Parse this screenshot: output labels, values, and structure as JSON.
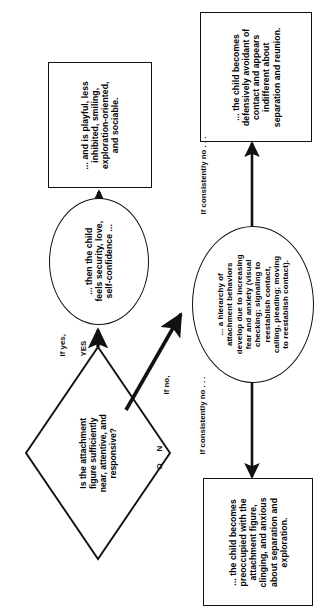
{
  "diagram": {
    "orientation_note": "rotated",
    "stroke_color": "#111111",
    "background_color": "#ffffff",
    "nodes": {
      "decision": {
        "shape": "diamond",
        "text": "Is the attachment\nfigure sufficiently\nnear, attentive, and\nresponsive?"
      },
      "secure_state": {
        "shape": "ellipse",
        "text": "... then the child\nfeels security, love,\nself-confidence ..."
      },
      "secure_outcome": {
        "shape": "rectangle",
        "text": "... and is playful, less\ninhibited, smiling,\nexploration-oriented,\nand sociable."
      },
      "anxiety_state": {
        "shape": "ellipse",
        "text": "... a hierarchy of\nattachment behaviors\ndevelop due to increasing\nfear and anxiety (visual\nchecking; signaling to\nreestablish contact,\ncalling, pleading; moving\nto reestablish contact)."
      },
      "avoidant_outcome": {
        "shape": "rectangle",
        "text": "... the child becomes\ndefensively avoidant of\ncontact and appears\nindifferent about\nseparation and reunion."
      },
      "preoccupied_outcome": {
        "shape": "rectangle",
        "text": "... the child becomes\npreoccupied with the\nattachment figure,\nclinging, and anxious\nabout separation and\nexploration."
      }
    },
    "edge_labels": {
      "if_yes": "If yes,",
      "yes": "YES",
      "if_no": "If no,",
      "no_n": "N",
      "no_o": "O",
      "if_consistently_no_top": "If consistently no . . .",
      "if_consistently_no_bottom": "If consistently no . . ."
    }
  }
}
